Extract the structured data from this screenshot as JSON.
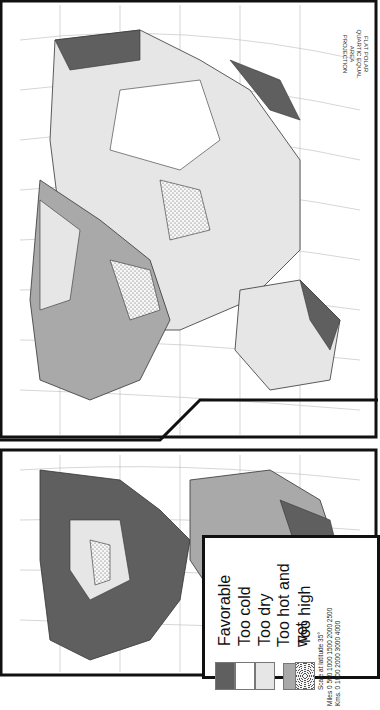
{
  "map": {
    "projection_label": [
      "FLAT POLAR",
      "QUARTIC EQUAL AREA",
      "PROJECTION"
    ],
    "orientation": "rotated 90°",
    "panels": [
      "Americas",
      "Eurasia-Africa-Australia"
    ],
    "longitude_labels_top": [
      "180",
      "160",
      "140",
      "120",
      "100",
      "80",
      "60",
      "40",
      "20",
      "0",
      "20",
      "40",
      "60",
      "80",
      "100",
      "120",
      "140",
      "160",
      "180"
    ],
    "latitude_labels": [
      "80",
      "70",
      "60",
      "50",
      "40",
      "30",
      "20",
      "10",
      "0",
      "10",
      "20",
      "30",
      "40",
      "50",
      "60",
      "70"
    ]
  },
  "legend": {
    "items": [
      {
        "label": "Favorable",
        "color": "#5f5f5f",
        "pattern": "solid"
      },
      {
        "label": "Too cold",
        "color": "#ffffff",
        "pattern": "solid"
      },
      {
        "label": "Too dry",
        "color": "#e6e6e6",
        "pattern": "solid"
      },
      {
        "label": "Too hot and wet",
        "color": "#a9a9a9",
        "pattern": "solid"
      },
      {
        "label": "Too high",
        "color": "#f4f4f4",
        "pattern": "dotted"
      }
    ],
    "scale_title": "Scale at latitude 35°",
    "miles_label": "Miles",
    "miles_ticks": [
      "0",
      "500",
      "1000",
      "1500",
      "2000",
      "2500"
    ],
    "kms_label": "Kms.",
    "kms_ticks": [
      "0",
      "1000",
      "2000",
      "3000",
      "4000"
    ]
  }
}
